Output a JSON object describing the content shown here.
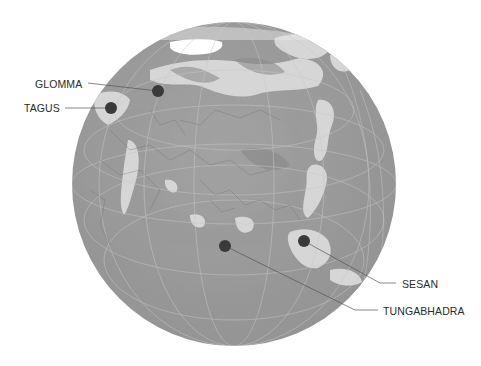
{
  "map": {
    "projection": "orthographic",
    "center": "Asia / Eurasia",
    "globe_color": "#9b9b9b",
    "land_highlight_color": "#d9d9d9",
    "ice_color": "#ffffff",
    "marker_color": "#3a3a3a",
    "leader_color": "#555555"
  },
  "markers": [
    {
      "name": "GLOMMA",
      "x": 158,
      "y": 91
    },
    {
      "name": "TAGUS",
      "x": 111,
      "y": 108
    },
    {
      "name": "TUNGABHADRA",
      "x": 225,
      "y": 246
    },
    {
      "name": "SESAN",
      "x": 304,
      "y": 241
    }
  ],
  "labels": {
    "glomma": "GLOMMA",
    "tagus": "TAGUS",
    "sesan": "SESAN",
    "tungabhadra": "TUNGABHADRA"
  }
}
